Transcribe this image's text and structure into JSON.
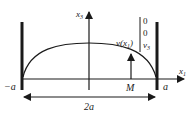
{
  "diagram": {
    "axes": {
      "horizontal": {
        "label": "x",
        "sub": "1"
      },
      "vertical": {
        "label": "x",
        "sub": "3"
      }
    },
    "walls": {
      "left_label": "−a",
      "right_label": "a"
    },
    "width_label": "2a",
    "point_label": "M",
    "velocity": {
      "label": "v(x",
      "label_sub": "1",
      "label_close": ")",
      "components": [
        "0",
        "0",
        "v"
      ],
      "component_sub": "3"
    },
    "colors": {
      "ink": "#1a1a1a",
      "background": "#ffffff"
    }
  }
}
